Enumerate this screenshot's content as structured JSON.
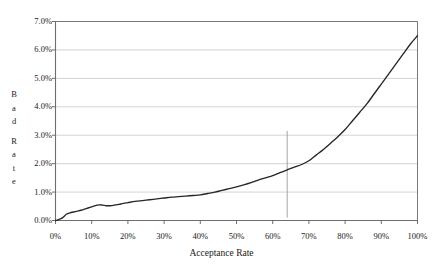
{
  "chart_data": {
    "type": "line",
    "title": "",
    "xlabel": "Acceptance Rate",
    "ylabel": "Bad Rate",
    "ylabel_letters": [
      "B",
      "a",
      "d",
      "",
      "R",
      "a",
      "t",
      "e"
    ],
    "xlim": [
      0,
      100
    ],
    "ylim": [
      0,
      7
    ],
    "grid": "horizontal",
    "legend": "none",
    "x_tick_labels": [
      "0%",
      "10%",
      "20%",
      "30%",
      "40%",
      "50%",
      "60%",
      "70%",
      "80%",
      "90%",
      "100%"
    ],
    "x_tick_values": [
      0,
      10,
      20,
      30,
      40,
      50,
      60,
      70,
      80,
      90,
      100
    ],
    "y_tick_labels": [
      "0.0%",
      "1.0%",
      "2.0%",
      "3.0%",
      "4.0%",
      "5.0%",
      "6.0%",
      "7.0%"
    ],
    "y_tick_values": [
      0,
      1,
      2,
      3,
      4,
      5,
      6,
      7
    ],
    "series": [
      {
        "name": "Bad Rate",
        "color": "#262626",
        "x": [
          0,
          1,
          2,
          3,
          4,
          5,
          6,
          7,
          8,
          9,
          10,
          11,
          12,
          13,
          14,
          15,
          16,
          17,
          18,
          19,
          20,
          22,
          24,
          26,
          28,
          30,
          32,
          34,
          36,
          38,
          40,
          42,
          44,
          46,
          48,
          50,
          52,
          54,
          56,
          58,
          60,
          62,
          64,
          66,
          68,
          70,
          72,
          74,
          76,
          78,
          80,
          82,
          84,
          86,
          88,
          90,
          92,
          94,
          96,
          98,
          100
        ],
        "values": [
          0.0,
          0.04,
          0.1,
          0.22,
          0.27,
          0.3,
          0.33,
          0.36,
          0.4,
          0.44,
          0.48,
          0.52,
          0.55,
          0.54,
          0.52,
          0.52,
          0.53,
          0.56,
          0.58,
          0.61,
          0.63,
          0.67,
          0.7,
          0.73,
          0.76,
          0.79,
          0.82,
          0.84,
          0.86,
          0.88,
          0.9,
          0.95,
          1.0,
          1.06,
          1.12,
          1.18,
          1.25,
          1.33,
          1.42,
          1.5,
          1.58,
          1.68,
          1.78,
          1.88,
          1.97,
          2.1,
          2.3,
          2.5,
          2.72,
          2.95,
          3.2,
          3.5,
          3.8,
          4.1,
          4.45,
          4.8,
          5.15,
          5.5,
          5.85,
          6.2,
          6.5
        ]
      }
    ],
    "reference_line": {
      "name": "acceptance-cutoff",
      "orientation": "vertical",
      "x": 64,
      "y_from": 0.1,
      "y_to": 3.15,
      "color": "#9a9a9a"
    },
    "style": {
      "grid_color": "#c8c8c8",
      "axis_color": "#7a7a7a",
      "plot_background": "#ffffff",
      "curve_color": "#262626"
    }
  }
}
